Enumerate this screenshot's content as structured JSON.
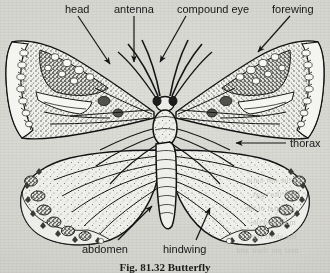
{
  "figure": {
    "caption": "Fig. 81.32  Butterfly",
    "background_color": "#e9e9e6",
    "ink_color": "#1a1a1a",
    "labels": [
      {
        "id": "head",
        "text": "head",
        "x": 65,
        "y": 4,
        "anchor": "start"
      },
      {
        "id": "antenna",
        "text": "antenna",
        "x": 114,
        "y": 4,
        "anchor": "start"
      },
      {
        "id": "compound-eye",
        "text": "compound eye",
        "x": 177,
        "y": 4,
        "anchor": "start"
      },
      {
        "id": "forewing",
        "text": "forewing",
        "x": 272,
        "y": 4,
        "anchor": "start"
      },
      {
        "id": "thorax",
        "text": "thorax",
        "x": 288,
        "y": 138,
        "anchor": "start"
      },
      {
        "id": "abdomen",
        "text": "abdomen",
        "x": 82,
        "y": 245,
        "anchor": "start"
      },
      {
        "id": "hindwing",
        "text": "hindwing",
        "x": 163,
        "y": 245,
        "anchor": "start"
      }
    ],
    "parts": [
      "head",
      "antenna",
      "compound eye",
      "forewing",
      "thorax",
      "abdomen",
      "hindwing"
    ],
    "bleed_through": [
      {
        "text": "of the nor suita",
        "x": 246,
        "y": 176
      },
      {
        "text": "TEN tha eggs",
        "x": 252,
        "y": 190
      },
      {
        "text": "hird pai of the",
        "x": 244,
        "y": 204
      },
      {
        "text": "male and the",
        "x": 250,
        "y": 218
      },
      {
        "text": "the short legs",
        "x": 248,
        "y": 232
      },
      {
        "text": "nest per their and",
        "x": 236,
        "y": 246
      }
    ]
  }
}
